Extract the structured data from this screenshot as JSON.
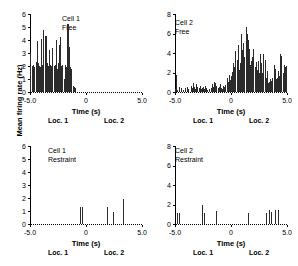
{
  "figure": {
    "ylabel": "Mean firing rate (Hz)",
    "bar_color": "#2b2b2b",
    "axis_color": "#000000"
  },
  "common": {
    "xlabel": "Time (s)",
    "xticks": [
      "-5.0",
      "0",
      "5.0"
    ],
    "loc1": "Loc. 1",
    "loc2": "Loc. 2"
  },
  "panels": [
    {
      "id": "cell1-free",
      "title_line1": "Cell 1",
      "title_line2": "Free",
      "yticks": [
        "0",
        "1",
        "2",
        "3",
        "4",
        "5",
        "6"
      ]
    },
    {
      "id": "cell2-free",
      "title_line1": "Cell 2",
      "title_line2": "Free",
      "yticks": [
        "0",
        "2",
        "4",
        "6",
        "8"
      ]
    },
    {
      "id": "cell1-restraint",
      "title_line1": "Cell 1",
      "title_line2": "Restraint",
      "yticks": [
        "0",
        "1",
        "2",
        "3",
        "4",
        "5",
        "6"
      ]
    },
    {
      "id": "cell2-restraint",
      "title_line1": "Cell 2",
      "title_line2": "Restraint",
      "yticks": [
        "0",
        "2",
        "4",
        "6",
        "8"
      ]
    }
  ],
  "chart_data": [
    {
      "type": "bar",
      "title": "Cell 1 Free",
      "xlabel": "Time (s)",
      "ylabel": "Mean firing rate (Hz)",
      "xlim": [
        -5.0,
        5.0
      ],
      "ylim": [
        0,
        6
      ],
      "grid": false,
      "bin_width": 0.1,
      "annotations": [
        "Loc. 1 at -2.5 s",
        "Loc. 2 at 2.5 s"
      ],
      "x": [
        -5.0,
        -4.9,
        -4.8,
        -4.7,
        -4.6,
        -4.5,
        -4.4,
        -4.3,
        -4.2,
        -4.1,
        -4.0,
        -3.9,
        -3.8,
        -3.7,
        -3.6,
        -3.5,
        -3.4,
        -3.3,
        -3.2,
        -3.1,
        -3.0,
        -2.9,
        -2.8,
        -2.7,
        -2.6,
        -2.5,
        -2.4,
        -2.3,
        -2.2,
        -2.1,
        -2.0,
        -1.9,
        -1.8,
        -1.7,
        -1.6,
        -1.5,
        -1.4,
        -1.3,
        -1.2,
        -1.1,
        -1.0,
        -0.9,
        -0.8,
        -0.7,
        -0.6,
        -0.5,
        -0.4,
        -0.3,
        -0.2,
        -0.1,
        0.0,
        0.1,
        0.2,
        0.3,
        0.4,
        0.5,
        1.0,
        2.0,
        3.0,
        4.0,
        5.0
      ],
      "values": [
        3.0,
        0.0,
        2.0,
        2.1,
        1.9,
        2.3,
        3.9,
        2.2,
        2.0,
        1.9,
        4.1,
        2.1,
        4.8,
        4.3,
        4.3,
        2.2,
        2.0,
        3.2,
        2.1,
        2.0,
        3.4,
        2.0,
        2.1,
        4.0,
        1.8,
        2.2,
        3.6,
        4.2,
        2.0,
        2.1,
        1.0,
        2.1,
        1.9,
        5.2,
        5.2,
        3.5,
        1.9,
        1.8,
        0.5,
        0.4,
        0.3,
        0.0,
        0.0,
        0.0,
        0.0,
        0.0,
        0.0,
        0.0,
        0.0,
        0.0,
        0.0,
        0.0,
        0.0,
        0.0,
        0.0,
        0.0,
        0.0,
        0.0,
        0.0,
        0.0,
        0.0
      ]
    },
    {
      "type": "bar",
      "title": "Cell 2 Free",
      "xlabel": "Time (s)",
      "ylabel": "Mean firing rate (Hz)",
      "xlim": [
        -5.0,
        5.0
      ],
      "ylim": [
        0,
        8
      ],
      "grid": false,
      "bin_width": 0.1,
      "annotations": [
        "Loc. 1 at -2.5 s",
        "Loc. 2 at 2.5 s"
      ],
      "x": [
        -5.0,
        -4.9,
        -4.8,
        -4.7,
        -4.6,
        -4.5,
        -4.4,
        -4.3,
        -4.2,
        -4.1,
        -4.0,
        -3.9,
        -3.8,
        -3.7,
        -3.6,
        -3.5,
        -3.4,
        -3.3,
        -3.2,
        -3.1,
        -3.0,
        -2.9,
        -2.8,
        -2.7,
        -2.6,
        -2.5,
        -2.4,
        -2.3,
        -2.2,
        -2.1,
        -2.0,
        -1.9,
        -1.8,
        -1.7,
        -1.6,
        -1.5,
        -1.4,
        -1.3,
        -1.2,
        -1.1,
        -1.0,
        -0.9,
        -0.8,
        -0.7,
        -0.6,
        -0.5,
        -0.4,
        -0.3,
        -0.2,
        -0.1,
        0.0,
        0.1,
        0.2,
        0.3,
        0.4,
        0.5,
        0.6,
        0.7,
        0.8,
        0.9,
        1.0,
        1.1,
        1.2,
        1.3,
        1.4,
        1.5,
        1.6,
        1.7,
        1.8,
        1.9,
        2.0,
        2.1,
        2.2,
        2.3,
        2.4,
        2.5,
        2.6,
        2.7,
        2.8,
        2.9,
        3.0,
        3.1,
        3.2,
        3.3,
        3.4,
        3.5,
        3.6,
        3.7,
        3.8,
        3.9,
        4.0,
        4.1,
        4.2,
        4.3,
        4.4,
        4.5,
        4.6,
        4.7,
        4.8,
        4.9,
        5.0
      ],
      "values": [
        0.3,
        1.7,
        0.2,
        0.0,
        0.5,
        0.4,
        0.0,
        0.2,
        0.0,
        0.4,
        0.0,
        0.5,
        0.3,
        0.0,
        0.6,
        0.4,
        0.9,
        0.5,
        0.3,
        0.8,
        0.5,
        0.4,
        0.6,
        0.3,
        0.4,
        0.5,
        0.3,
        0.6,
        0.4,
        0.2,
        0.3,
        0.0,
        0.4,
        0.8,
        0.5,
        1.0,
        0.9,
        0.6,
        0.4,
        0.5,
        0.8,
        0.4,
        0.3,
        0.6,
        0.5,
        0.7,
        1.4,
        1.0,
        1.7,
        1.2,
        1.6,
        2.1,
        3.0,
        2.6,
        4.2,
        3.3,
        4.8,
        2.3,
        3.0,
        5.9,
        4.3,
        5.0,
        3.6,
        6.7,
        6.0,
        5.3,
        4.4,
        2.8,
        3.2,
        3.6,
        4.4,
        2.6,
        3.1,
        2.3,
        3.2,
        1.9,
        3.9,
        3.0,
        2.0,
        3.9,
        3.3,
        1.4,
        2.2,
        0.9,
        1.0,
        1.3,
        1.1,
        1.4,
        2.8,
        2.4,
        1.3,
        1.4,
        2.2,
        1.6,
        3.9,
        3.7,
        2.0,
        2.8,
        2.6,
        2.7,
        2.7
      ]
    },
    {
      "type": "bar",
      "title": "Cell 1 Restraint",
      "xlabel": "Time (s)",
      "ylabel": "Mean firing rate (Hz)",
      "xlim": [
        -5.0,
        5.0
      ],
      "ylim": [
        0,
        6
      ],
      "grid": false,
      "bin_width": 0.1,
      "annotations": [
        "Loc. 1 at -2.5 s",
        "Loc. 2 at 2.5 s"
      ],
      "x": [
        -0.5,
        -0.4,
        1.9,
        2.4,
        3.3
      ],
      "values": [
        1.3,
        1.3,
        1.3,
        0.9,
        1.9
      ]
    },
    {
      "type": "bar",
      "title": "Cell 2 Restraint",
      "xlabel": "Time (s)",
      "ylabel": "Mean firing rate (Hz)",
      "xlim": [
        -5.0,
        5.0
      ],
      "ylim": [
        0,
        8
      ],
      "grid": false,
      "bin_width": 0.1,
      "annotations": [
        "Loc. 1 at -2.5 s",
        "Loc. 2 at 2.5 s"
      ],
      "x": [
        -4.8,
        -4.6,
        -2.6,
        -2.4,
        -1.3,
        1.5,
        3.1,
        3.4,
        3.6,
        3.9,
        4.2
      ],
      "values": [
        1.1,
        1.1,
        2.0,
        1.1,
        1.3,
        1.1,
        1.1,
        1.4,
        1.2,
        1.4,
        1.4
      ]
    }
  ]
}
